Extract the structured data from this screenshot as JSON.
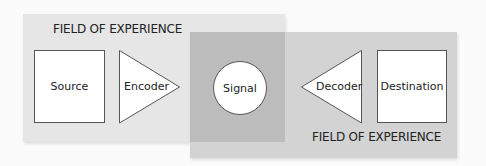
{
  "diagram": {
    "fields": [
      {
        "label": "FIELD OF EXPERIENCE",
        "side": "sender"
      },
      {
        "label": "FIELD OF EXPERIENCE",
        "side": "receiver"
      }
    ],
    "nodes": {
      "source": "Source",
      "encoder": "Encoder",
      "signal": "Signal",
      "decoder": "Decoder",
      "destination": "Destination"
    },
    "colors": {
      "sender_field": "#e6e6e6",
      "receiver_field": "#d3d3d3",
      "overlap": "#bcbcbc",
      "node_fill": "#ffffff",
      "stroke": "#555555"
    }
  }
}
